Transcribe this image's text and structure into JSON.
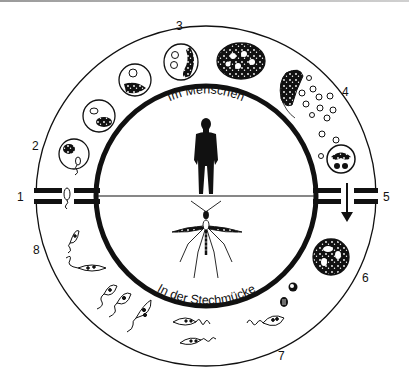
{
  "diagram": {
    "colors": {
      "ink": "#111111",
      "background": "#ffffff",
      "rule": "#a8a8a8"
    },
    "inner_labels": {
      "top": "Im Menschen",
      "bottom": "In der Stechmücke"
    },
    "center_icons": {
      "top": "human-silhouette-icon",
      "bottom": "mosquito-icon"
    },
    "stage_numbers": [
      {
        "id": "1",
        "label": "1",
        "position": "left"
      },
      {
        "id": "2",
        "label": "2",
        "position": "upper-left"
      },
      {
        "id": "3",
        "label": "3",
        "position": "top"
      },
      {
        "id": "4",
        "label": "4",
        "position": "upper-right"
      },
      {
        "id": "5",
        "label": "5",
        "position": "right"
      },
      {
        "id": "6",
        "label": "6",
        "position": "lower-right"
      },
      {
        "id": "7",
        "label": "7",
        "position": "bottom"
      },
      {
        "id": "8",
        "label": "8",
        "position": "lower-left"
      }
    ],
    "transitions": {
      "left": "gap-bars (Übertragung Mücke → Mensch)",
      "right": "gap-bars with down arrow (Übertragung Mensch → Mücke)"
    }
  }
}
